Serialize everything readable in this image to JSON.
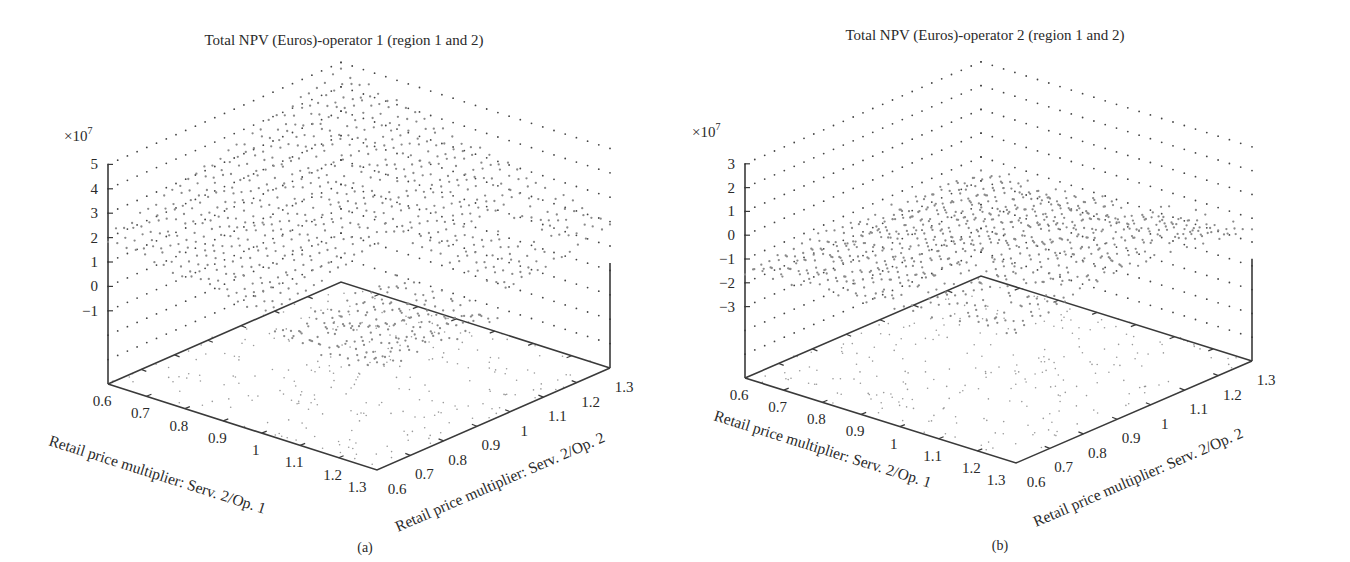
{
  "figure": {
    "panels": [
      {
        "id": "a",
        "caption": "(a)",
        "title": "Total NPV (Euros)-operator 1 (region 1 and 2)",
        "z_multiplier": "×10",
        "z_exponent": "7",
        "x_label": "Retail price multiplier: Serv. 2/Op. 1",
        "y_label": "Retail price multiplier: Serv. 2/Op. 2",
        "x_ticks": [
          "0.6",
          "0.7",
          "0.8",
          "0.9",
          "1",
          "1.1",
          "1.2",
          "1.3"
        ],
        "y_ticks": [
          "0.6",
          "0.7",
          "0.8",
          "0.9",
          "1",
          "1.1",
          "1.2",
          "1.3"
        ],
        "z_ticks": [
          "5",
          "4",
          "3",
          "2",
          "1",
          "0",
          "−1"
        ]
      },
      {
        "id": "b",
        "caption": "(b)",
        "title": "Total NPV (Euros)-operator 2 (region 1 and 2)",
        "z_multiplier": "×10",
        "z_exponent": "7",
        "x_label": "Retail price multiplier: Serv. 2/Op. 1",
        "y_label": "Retail price multiplier: Serv. 2/Op. 2",
        "x_ticks": [
          "0.6",
          "0.7",
          "0.8",
          "0.9",
          "1",
          "1.1",
          "1.2",
          "1.3"
        ],
        "y_ticks": [
          "0.6",
          "0.7",
          "0.8",
          "0.9",
          "1",
          "1.1",
          "1.2",
          "1.3"
        ],
        "z_ticks": [
          "3",
          "2",
          "1",
          "0",
          "−1",
          "−2",
          "−3"
        ]
      }
    ]
  },
  "chart_data": [
    {
      "type": "scatter",
      "subtype": "3d-scatter",
      "title": "Total NPV (Euros)-operator 1 (region 1 and 2)",
      "xlabel": "Retail price multiplier: Serv. 2/Op. 1",
      "ylabel": "Retail price multiplier: Serv. 2/Op. 2",
      "zlabel": "Total NPV (Euros) ×10^7",
      "x_range": [
        0.6,
        1.3
      ],
      "y_range": [
        0.6,
        1.3
      ],
      "zlim": [
        -4,
        5
      ],
      "z_ticks": [
        5,
        4,
        3,
        2,
        1,
        0,
        -1
      ],
      "grid": true,
      "grid_step": 0.1,
      "surface_trend": {
        "description": "NPV rises with Op.2 price multiplier and falls with Op.1 price multiplier; peak approx 4.5e7 near Op.1=0.6, Op.2=1.3; lowest approx 0 near Op.1=1.3, Op.2=0.6",
        "corner_values_e7": {
          "op1_0.6_op2_0.6": 2.0,
          "op1_0.6_op2_1.3": 4.5,
          "op1_1.3_op2_0.6": 0.3,
          "op1_1.3_op2_1.3": 0.5
        }
      },
      "floor_projection": true
    },
    {
      "type": "scatter",
      "subtype": "3d-scatter",
      "title": "Total NPV (Euros)-operator 2 (region 1 and 2)",
      "xlabel": "Retail price multiplier: Serv. 2/Op. 1",
      "ylabel": "Retail price multiplier: Serv. 2/Op. 2",
      "zlabel": "Total NPV (Euros) ×10^7",
      "x_range": [
        0.6,
        1.3
      ],
      "y_range": [
        0.6,
        1.3
      ],
      "zlim": [
        -6,
        3
      ],
      "z_ticks": [
        3,
        2,
        1,
        0,
        -1,
        -2,
        -3
      ],
      "grid": true,
      "grid_step": 0.1,
      "surface_trend": {
        "description": "NPV mostly between -2e7 and 1e7; higher toward high Op.1 / mid Op.2, lower toward low Op.1; noisy ridge around 0 to 1e7",
        "corner_values_e7": {
          "op1_0.6_op2_0.6": -1.5,
          "op1_0.6_op2_1.3": -0.8,
          "op1_1.3_op2_0.6": -1.8,
          "op1_1.3_op2_1.3": 0.5
        }
      },
      "floor_projection": true
    }
  ]
}
